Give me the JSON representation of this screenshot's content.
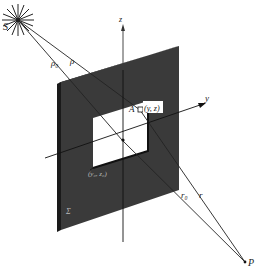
{
  "diagram": {
    "type": "diffraction-geometry",
    "labels": {
      "source": "S",
      "rho0": "ρ₀",
      "rho": "ρ",
      "z_axis": "z",
      "y_axis": "y",
      "origin": "O",
      "point_a": "A",
      "point_a_coords": "(y, z)",
      "aperture_corner": "(y₀, z₀)",
      "screen": "Σ",
      "r0": "r₀",
      "r": "r",
      "observer": "P"
    },
    "colors": {
      "screen": "#3a3a3a",
      "screen_edge": "#1a1a1a",
      "aperture": "#ffffff",
      "lines": "#222222",
      "background": "#ffffff"
    }
  }
}
